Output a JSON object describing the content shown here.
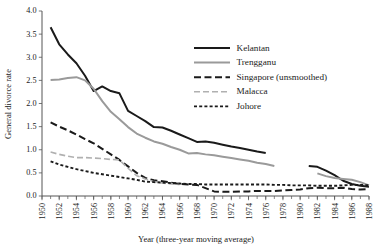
{
  "chart_data": {
    "type": "line",
    "title": "",
    "xlabel": "Year (three-year moving average)",
    "ylabel": "General divorce rate",
    "xlim": [
      1950,
      1988
    ],
    "ylim": [
      0.0,
      4.0
    ],
    "grid": false,
    "legend_position": "upper-right",
    "y_ticks": [
      "0.0",
      "0.5",
      "1.0",
      "1.5",
      "2.0",
      "2.5",
      "3.0",
      "3.5",
      "4.0"
    ],
    "y_tick_values": [
      0.0,
      0.5,
      1.0,
      1.5,
      2.0,
      2.5,
      3.0,
      3.5,
      4.0
    ],
    "x_ticks": [
      "1950",
      "1952",
      "1954",
      "1956",
      "1958",
      "1960",
      "1962",
      "1964",
      "1966",
      "1968",
      "1970",
      "1972",
      "1974",
      "1976",
      "1978",
      "1980",
      "1982",
      "1984",
      "1986",
      "1988"
    ],
    "x_tick_values": [
      1950,
      1952,
      1954,
      1956,
      1958,
      1960,
      1962,
      1964,
      1966,
      1968,
      1970,
      1972,
      1974,
      1976,
      1978,
      1980,
      1982,
      1984,
      1986,
      1988
    ],
    "x_minor_step": 1,
    "series": [
      {
        "name": "Kelantan",
        "color": "#1a1a1a",
        "style": "solid",
        "width": 2.0,
        "dash": "",
        "segments": [
          {
            "x": [
              1951,
              1952,
              1953,
              1954,
              1955,
              1956,
              1957,
              1958,
              1959,
              1960,
              1961,
              1962,
              1963,
              1964,
              1965,
              1966,
              1967,
              1968,
              1969,
              1970,
              1971,
              1972,
              1973,
              1974,
              1975,
              1976
            ],
            "y": [
              3.65,
              3.28,
              3.06,
              2.87,
              2.6,
              2.27,
              2.37,
              2.27,
              2.22,
              1.84,
              1.73,
              1.62,
              1.49,
              1.48,
              1.41,
              1.33,
              1.25,
              1.17,
              1.18,
              1.15,
              1.11,
              1.07,
              1.04,
              1.0,
              0.96,
              0.93
            ]
          },
          {
            "x": [
              1981,
              1982,
              1983,
              1984,
              1985,
              1986,
              1987,
              1988
            ],
            "y": [
              0.65,
              0.63,
              0.55,
              0.45,
              0.33,
              0.26,
              0.22,
              0.2
            ]
          }
        ]
      },
      {
        "name": "Trengganu",
        "color": "#9a9a9a",
        "style": "solid",
        "width": 2.0,
        "dash": "",
        "segments": [
          {
            "x": [
              1951,
              1952,
              1953,
              1954,
              1955,
              1956,
              1957,
              1958,
              1959,
              1960,
              1961,
              1962,
              1963,
              1964,
              1965,
              1966,
              1967,
              1968,
              1969,
              1970,
              1971,
              1972,
              1973,
              1974,
              1975,
              1976,
              1977
            ],
            "y": [
              2.51,
              2.52,
              2.55,
              2.57,
              2.5,
              2.32,
              2.05,
              1.82,
              1.66,
              1.49,
              1.35,
              1.26,
              1.18,
              1.13,
              1.06,
              1.0,
              0.92,
              0.93,
              0.9,
              0.88,
              0.85,
              0.82,
              0.79,
              0.76,
              0.72,
              0.69,
              0.65
            ]
          },
          {
            "x": [
              1982,
              1983,
              1984,
              1985,
              1986,
              1987,
              1988
            ],
            "y": [
              0.49,
              0.43,
              0.39,
              0.37,
              0.35,
              0.3,
              0.23
            ]
          }
        ]
      },
      {
        "name": "Singapore (unsmoothed)",
        "color": "#1a1a1a",
        "style": "dashed",
        "width": 2.0,
        "dash": "7 3.5",
        "segments": [
          {
            "x": [
              1951,
              1952,
              1953,
              1954,
              1955,
              1956,
              1957,
              1958,
              1959,
              1960,
              1961,
              1962,
              1963,
              1964,
              1965,
              1966,
              1967,
              1968,
              1969,
              1970,
              1971,
              1972,
              1973,
              1974,
              1975,
              1976,
              1977,
              1978,
              1979,
              1980,
              1981,
              1982,
              1983,
              1984,
              1985,
              1986,
              1987,
              1988
            ],
            "y": [
              1.59,
              1.5,
              1.42,
              1.33,
              1.23,
              1.14,
              1.02,
              0.9,
              0.78,
              0.64,
              0.5,
              0.39,
              0.34,
              0.32,
              0.29,
              0.26,
              0.25,
              0.24,
              0.17,
              0.1,
              0.09,
              0.09,
              0.1,
              0.1,
              0.11,
              0.11,
              0.11,
              0.12,
              0.13,
              0.14,
              0.17,
              0.18,
              0.17,
              0.17,
              0.18,
              0.15,
              0.14,
              0.15
            ]
          }
        ]
      },
      {
        "name": "Malacca",
        "color": "#b0b0b0",
        "style": "dashed",
        "width": 1.6,
        "dash": "6 3",
        "segments": [
          {
            "x": [
              1951,
              1952,
              1953,
              1954,
              1955,
              1956,
              1957,
              1958,
              1959,
              1960,
              1961,
              1962,
              1963,
              1964,
              1965,
              1966
            ],
            "y": [
              0.95,
              0.9,
              0.86,
              0.83,
              0.83,
              0.82,
              0.81,
              0.79,
              0.78,
              0.6,
              0.44,
              0.37,
              0.31,
              0.28,
              0.26,
              0.25
            ]
          }
        ]
      },
      {
        "name": "Johore",
        "color": "#1a1a1a",
        "style": "dotted",
        "width": 1.9,
        "dash": "3 2.2",
        "segments": [
          {
            "x": [
              1951,
              1952,
              1953,
              1954,
              1955,
              1956,
              1957,
              1958,
              1959,
              1960,
              1961,
              1962,
              1963,
              1964,
              1965,
              1966,
              1967,
              1968,
              1969,
              1970,
              1971,
              1972,
              1973,
              1974,
              1975,
              1976,
              1977,
              1978,
              1979,
              1980,
              1981,
              1982,
              1983,
              1984,
              1985,
              1986,
              1987,
              1988
            ],
            "y": [
              0.75,
              0.68,
              0.63,
              0.58,
              0.54,
              0.5,
              0.47,
              0.44,
              0.41,
              0.38,
              0.35,
              0.31,
              0.3,
              0.29,
              0.28,
              0.27,
              0.26,
              0.26,
              0.25,
              0.25,
              0.25,
              0.25,
              0.25,
              0.25,
              0.25,
              0.25,
              0.24,
              0.24,
              0.23,
              0.23,
              0.23,
              0.22,
              0.22,
              0.22,
              0.23,
              0.24,
              0.24,
              0.23
            ]
          }
        ]
      }
    ]
  },
  "legend": {
    "entries": [
      {
        "label": "Kelantan"
      },
      {
        "label": "Trengganu"
      },
      {
        "label": "Singapore (unsmoothed)"
      },
      {
        "label": "Malacca"
      },
      {
        "label": "Johore"
      }
    ]
  },
  "colors": {
    "kelantan": "#1a1a1a",
    "trengganu": "#9a9a9a",
    "singapore": "#1a1a1a",
    "malacca": "#b0b0b0",
    "johore": "#1a1a1a",
    "axis": "#555555",
    "background": "#ffffff"
  }
}
